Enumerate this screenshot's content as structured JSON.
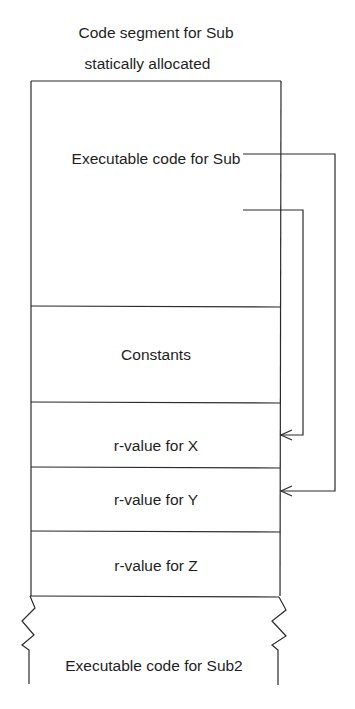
{
  "diagram": {
    "title_line1": "Code segment for Sub",
    "title_line2": "statically allocated",
    "segments": [
      {
        "id": "exec-sub",
        "label": "Executable code for Sub"
      },
      {
        "id": "constants",
        "label": "Constants"
      },
      {
        "id": "rvalue-x",
        "label": "r-value for X"
      },
      {
        "id": "rvalue-y",
        "label": "r-value for Y"
      },
      {
        "id": "rvalue-z",
        "label": "r-value for Z"
      },
      {
        "id": "exec-sub2",
        "label": "Executable code for Sub2"
      }
    ],
    "arrows": [
      {
        "from": "Executable code for Sub",
        "to": "r-value for X"
      },
      {
        "from": "Executable code for Sub",
        "to": "r-value for Y"
      }
    ],
    "colors": {
      "line": "#2a2a2a",
      "text": "#1e1e1e",
      "background": "#ffffff"
    }
  }
}
